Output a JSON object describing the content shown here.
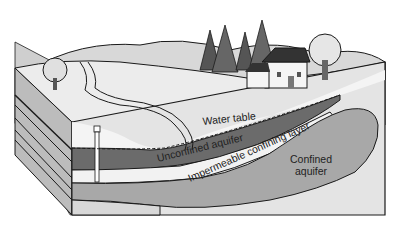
{
  "diagram": {
    "labels": {
      "water_table": "Water table",
      "unconfined_aquifer": "Unconfined aquifer",
      "impermeable_layer": "Impermeable confining layer",
      "confined_aquifer_line1": "Confined",
      "confined_aquifer_line2": "aquifer"
    },
    "elements": [
      "hills",
      "trees",
      "house",
      "stream",
      "well",
      "soil-block"
    ],
    "colors": {
      "outline": "#1a1a1a",
      "unconfined": "#6b6b6b",
      "confined": "#a8a8a8",
      "impermeable": "#f2f2f2",
      "bedrock": "#c8c8c8",
      "ground": "#ececec"
    }
  }
}
